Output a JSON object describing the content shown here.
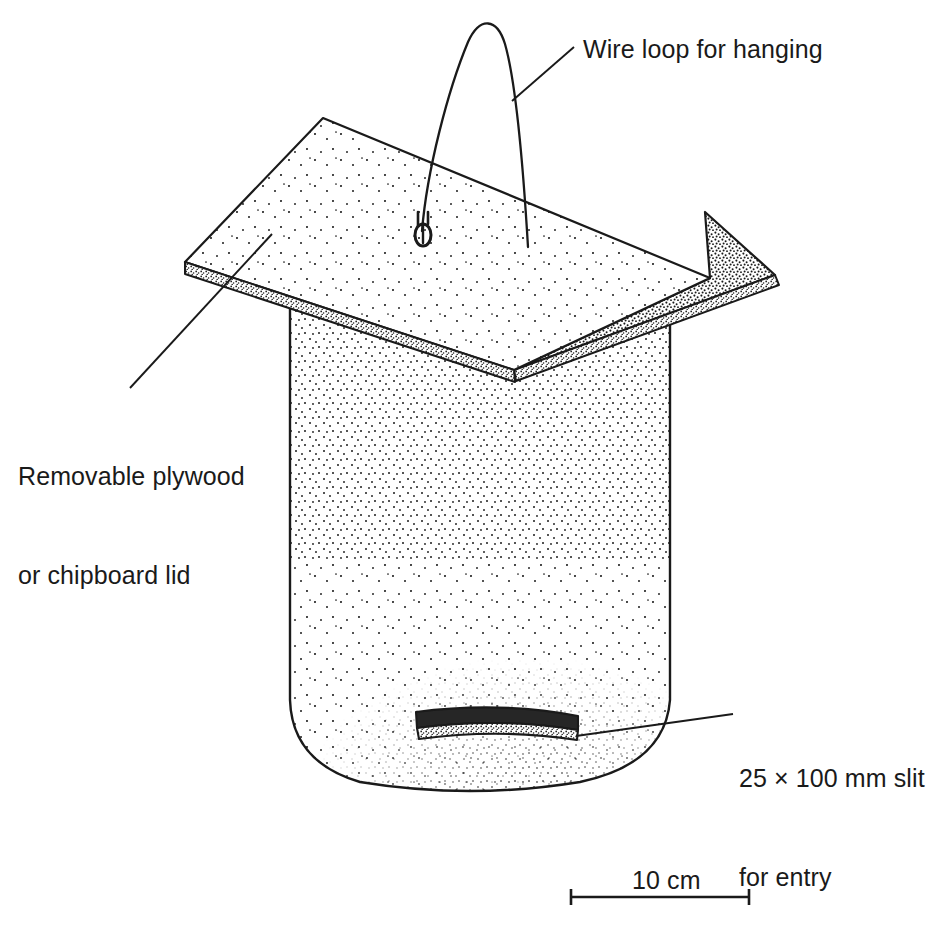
{
  "figure": {
    "background_color": "#ffffff",
    "ink_color": "#1a1a1a"
  },
  "labels": {
    "wire_loop": "Wire loop for hanging",
    "lid_line1": "Removable plywood",
    "lid_line2": "or chipboard lid",
    "slit_line1": "25 × 100 mm slit",
    "slit_line2": "for entry"
  },
  "scale_bar": {
    "label": "10 cm",
    "length_cm": 10
  },
  "parts": [
    {
      "name": "wire-loop",
      "description": "wire loop for hanging"
    },
    {
      "name": "screw-eye",
      "description": "small screw eye on roof"
    },
    {
      "name": "roof-left-panel",
      "description": "light stippled plywood lid panel"
    },
    {
      "name": "roof-right-panel",
      "description": "dark stippled plywood lid panel"
    },
    {
      "name": "body",
      "description": "stippled box body with rounded bottom"
    },
    {
      "name": "entry-slit",
      "description": "25 x 100 mm entry slit"
    }
  ]
}
